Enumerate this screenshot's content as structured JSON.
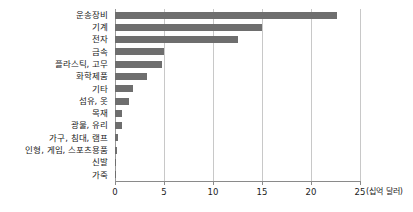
{
  "chart_data": {
    "type": "bar",
    "orientation": "horizontal",
    "title": "",
    "xlabel": "(십억 달러)",
    "ylabel": "",
    "xlim": [
      0,
      25
    ],
    "xticks": [
      "0",
      "5",
      "10",
      "15",
      "20",
      "25"
    ],
    "xtick_values": [
      0,
      5,
      10,
      15,
      20,
      25
    ],
    "grid": true,
    "legend": "none",
    "bar_color": "#6e6e6e",
    "gridline_color": "#c8c8c8",
    "background_color": "#ffffff",
    "categories": [
      "운송장비",
      "기계",
      "전자",
      "금속",
      "플라스틱, 고무",
      "화학제품",
      "기타",
      "섬유, 옷",
      "목재",
      "광물, 유리",
      "가구, 침대, 램프",
      "인형, 게임, 스포츠용품",
      "신발",
      "가죽"
    ],
    "values": [
      22.7,
      15.0,
      12.6,
      5.0,
      4.8,
      3.3,
      1.8,
      1.4,
      0.7,
      0.7,
      0.35,
      0.25,
      0.15,
      0.12
    ],
    "unit": "십억 달러"
  }
}
